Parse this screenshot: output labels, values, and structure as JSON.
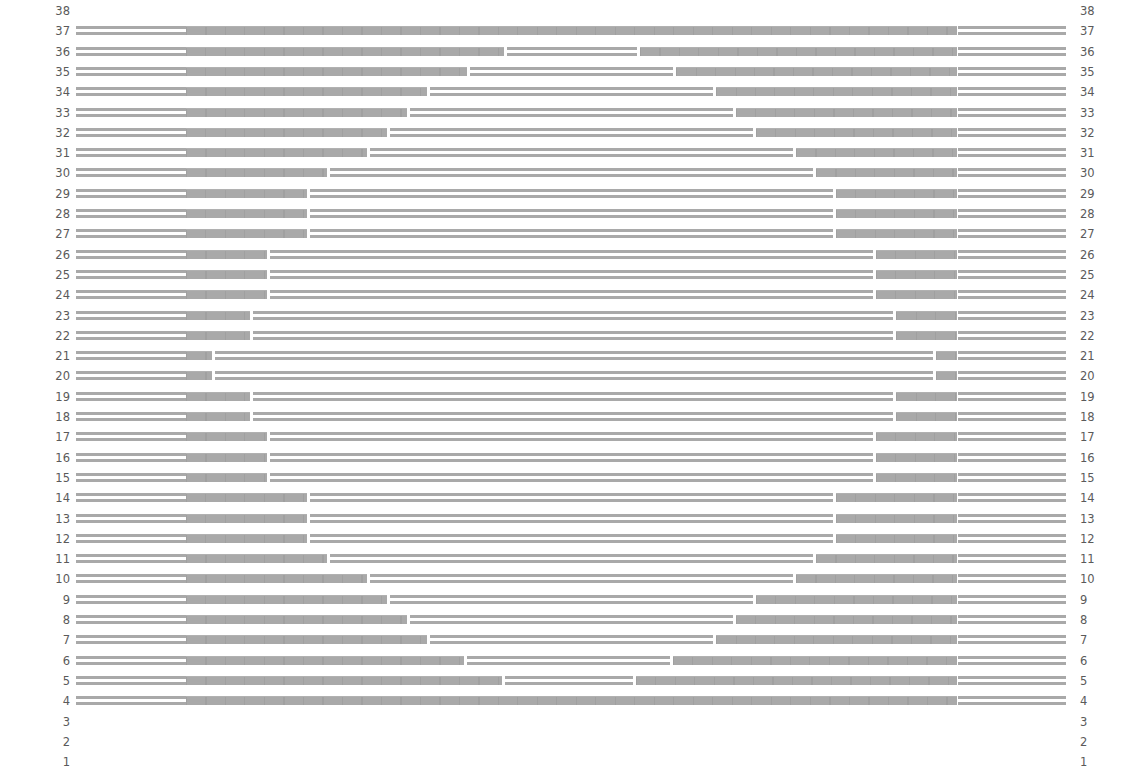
{
  "chart_data": {
    "type": "table",
    "title": "",
    "row_labels": [
      38,
      37,
      36,
      35,
      34,
      33,
      32,
      31,
      30,
      29,
      28,
      27,
      26,
      25,
      24,
      23,
      22,
      21,
      20,
      19,
      18,
      17,
      16,
      15,
      14,
      13,
      12,
      11,
      10,
      9,
      8,
      7,
      6,
      5,
      4,
      3,
      2,
      1
    ],
    "layout": {
      "row_pitch_px": 20.3,
      "first_row_top_px": 0,
      "left_band": [
        76,
        186
      ],
      "unit_field": [
        186,
        957
      ],
      "right_band": [
        958,
        1066
      ],
      "unit_width_px": 19.5
    },
    "rows": [
      {
        "row": 38,
        "active": false
      },
      {
        "row": 37,
        "active": true,
        "middle_block": null
      },
      {
        "row": 36,
        "active": true,
        "middle_block": [
          507,
          637
        ]
      },
      {
        "row": 35,
        "active": true,
        "middle_block": [
          470,
          673
        ]
      },
      {
        "row": 34,
        "active": true,
        "middle_block": [
          430,
          713
        ]
      },
      {
        "row": 33,
        "active": true,
        "middle_block": [
          410,
          733
        ]
      },
      {
        "row": 32,
        "active": true,
        "middle_block": [
          390,
          753
        ]
      },
      {
        "row": 31,
        "active": true,
        "middle_block": [
          370,
          793
        ]
      },
      {
        "row": 30,
        "active": true,
        "middle_block": [
          330,
          813
        ]
      },
      {
        "row": 29,
        "active": true,
        "middle_block": [
          310,
          833
        ]
      },
      {
        "row": 28,
        "active": true,
        "middle_block": [
          310,
          833
        ]
      },
      {
        "row": 27,
        "active": true,
        "middle_block": [
          310,
          833
        ]
      },
      {
        "row": 26,
        "active": true,
        "middle_block": [
          270,
          873
        ]
      },
      {
        "row": 25,
        "active": true,
        "middle_block": [
          270,
          873
        ]
      },
      {
        "row": 24,
        "active": true,
        "middle_block": [
          270,
          873
        ]
      },
      {
        "row": 23,
        "active": true,
        "middle_block": [
          253,
          893
        ]
      },
      {
        "row": 22,
        "active": true,
        "middle_block": [
          253,
          893
        ]
      },
      {
        "row": 21,
        "active": true,
        "middle_block": [
          215,
          933
        ]
      },
      {
        "row": 20,
        "active": true,
        "middle_block": [
          215,
          933
        ]
      },
      {
        "row": 19,
        "active": true,
        "middle_block": [
          253,
          893
        ]
      },
      {
        "row": 18,
        "active": true,
        "middle_block": [
          253,
          893
        ]
      },
      {
        "row": 17,
        "active": true,
        "middle_block": [
          270,
          873
        ]
      },
      {
        "row": 16,
        "active": true,
        "middle_block": [
          270,
          873
        ]
      },
      {
        "row": 15,
        "active": true,
        "middle_block": [
          270,
          873
        ]
      },
      {
        "row": 14,
        "active": true,
        "middle_block": [
          310,
          833
        ]
      },
      {
        "row": 13,
        "active": true,
        "middle_block": [
          310,
          833
        ]
      },
      {
        "row": 12,
        "active": true,
        "middle_block": [
          310,
          833
        ]
      },
      {
        "row": 11,
        "active": true,
        "middle_block": [
          330,
          813
        ]
      },
      {
        "row": 10,
        "active": true,
        "middle_block": [
          370,
          793
        ]
      },
      {
        "row": 9,
        "active": true,
        "middle_block": [
          390,
          753
        ]
      },
      {
        "row": 8,
        "active": true,
        "middle_block": [
          410,
          733
        ]
      },
      {
        "row": 7,
        "active": true,
        "middle_block": [
          430,
          713
        ]
      },
      {
        "row": 6,
        "active": true,
        "middle_block": [
          467,
          670
        ]
      },
      {
        "row": 5,
        "active": true,
        "middle_block": [
          505,
          633
        ]
      },
      {
        "row": 4,
        "active": true,
        "middle_block": null
      },
      {
        "row": 3,
        "active": false
      },
      {
        "row": 2,
        "active": false
      },
      {
        "row": 1,
        "active": false
      }
    ],
    "colors": {
      "bar": "#a9a9a9",
      "label": "#5a5a5a",
      "background": "#ffffff"
    },
    "grid": false,
    "legend": null
  }
}
